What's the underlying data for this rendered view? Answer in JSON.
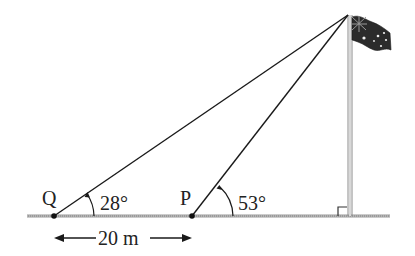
{
  "diagram": {
    "labels": {
      "point_q": "Q",
      "point_p": "P",
      "angle_q": "28°",
      "angle_p": "53°",
      "distance": "20 m"
    },
    "colors": {
      "line": "#1a1a1a",
      "ground": "#8a8a8a",
      "pole": "#9a9a9a",
      "flag": "#2a2a2a"
    }
  }
}
